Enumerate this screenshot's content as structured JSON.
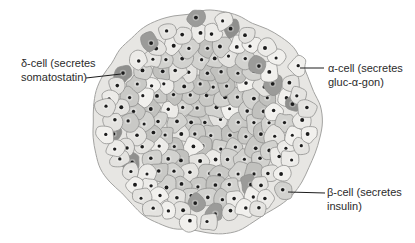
{
  "diagram": {
    "labels": {
      "delta": {
        "line1": "δ-cell (secretes",
        "line2": "somatostatin)"
      },
      "alpha": {
        "line1": "α-cell (secretes",
        "line2": "gluc-α-gon)"
      },
      "beta": {
        "line1": "β-cell (secretes",
        "line2": "insulin)"
      }
    },
    "colors": {
      "background": "#ffffff",
      "capsule_fill": "#e7e6e3",
      "capsule_stroke": "#a3a3a1",
      "alpha_cell_fills": [
        "#ecebe8",
        "#e4e3e0",
        "#f1f0ed"
      ],
      "beta_cell_fills": [
        "#c9c9c6",
        "#c1c1be",
        "#d2d2cf"
      ],
      "delta_cell_fills": [
        "#8f8f8d",
        "#9b9b99"
      ],
      "cell_stroke": "#8d8d8b",
      "nucleus": "#1c1c1c",
      "pointer_line": "#1c1c1c",
      "label_text": "#2b2b2b"
    }
  }
}
